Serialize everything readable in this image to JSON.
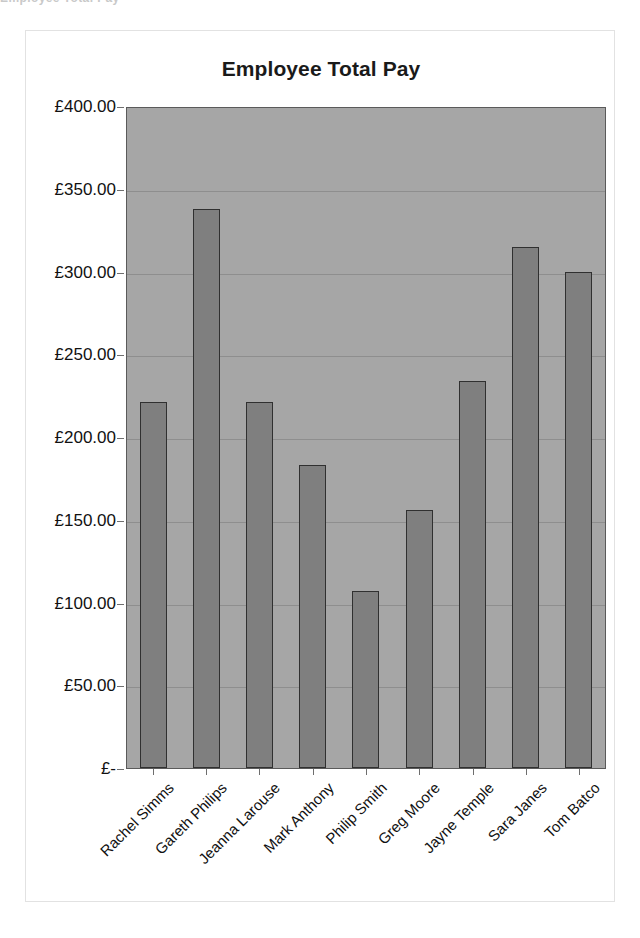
{
  "page": {
    "top_sliver_text": "Employee Total Pay"
  },
  "chart_data": {
    "type": "bar",
    "title": "Employee Total Pay",
    "xlabel": "",
    "ylabel": "",
    "categories": [
      "Rachel Simms",
      "Gareth Philips",
      "Jeanna Larouse",
      "Mark Anthony",
      "Philip Smith",
      "Greg Moore",
      "Jayne Temple",
      "Sara Janes",
      "Tom Batco"
    ],
    "values": [
      221,
      338,
      221,
      183,
      107,
      156,
      234,
      315,
      300
    ],
    "ylim": [
      0,
      400
    ],
    "ytick_values": [
      400,
      350,
      300,
      250,
      200,
      150,
      100,
      50,
      0
    ],
    "ytick_labels": [
      "£400.00",
      "£350.00",
      "£300.00",
      "£250.00",
      "£200.00",
      "£150.00",
      "£100.00",
      "£50.00",
      "£-"
    ],
    "grid": true,
    "legend": false,
    "legend_position": "none",
    "currency_symbol": "£",
    "colors": {
      "bar_fill": "#7f7f7f",
      "bar_border": "#303030",
      "plot_background": "#a6a6a6",
      "gridline": "#8e8e8e",
      "chart_background": "#ffffff",
      "text": "#111111"
    }
  }
}
